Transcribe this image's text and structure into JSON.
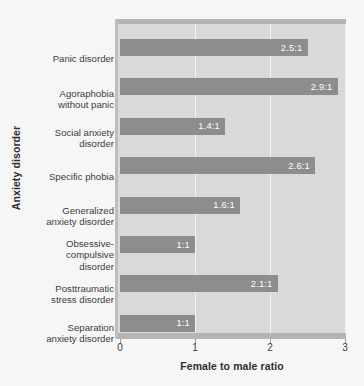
{
  "chart_data": {
    "type": "bar",
    "orientation": "horizontal",
    "title": "",
    "xlabel": "Female to male ratio",
    "ylabel": "Anxiety disorder",
    "xlim": [
      0,
      3
    ],
    "xticks": [
      "0",
      "1",
      "2",
      "3"
    ],
    "grid": true,
    "legend": null,
    "categories": [
      "Panic disorder",
      "Agoraphobia without panic",
      "Social anxiety disorder",
      "Specific phobia",
      "Generalized anxiety disorder",
      "Obsessive-compulsive disorder",
      "Posttraumatic stress disorder",
      "Separation anxiety disorder"
    ],
    "values": [
      2.5,
      2.9,
      1.4,
      2.6,
      1.6,
      1.0,
      2.1,
      1.0
    ],
    "data_labels": [
      "2.5:1",
      "2.9:1",
      "1.4:1",
      "2.6:1",
      "1.6:1",
      "1:1",
      "2.1:1",
      "1:1"
    ]
  },
  "category_label_lines": [
    [
      "Panic disorder"
    ],
    [
      "Agoraphobia",
      "without panic"
    ],
    [
      "Social anxiety",
      "disorder"
    ],
    [
      "Specific phobia"
    ],
    [
      "Generalized",
      "anxiety disorder"
    ],
    [
      "Obsessive-",
      "compulsive",
      "disorder"
    ],
    [
      "Posttraumatic",
      "stress disorder"
    ],
    [
      "Separation",
      "anxiety disorder"
    ]
  ],
  "colors": {
    "bar": "#8d8d8d",
    "plot_background": "#d9d9d9",
    "figure_background": "#f6f6f6",
    "gridline": "#f3f3f3",
    "value_text": "#ffffff",
    "axis_text": "#3c3c3c"
  }
}
